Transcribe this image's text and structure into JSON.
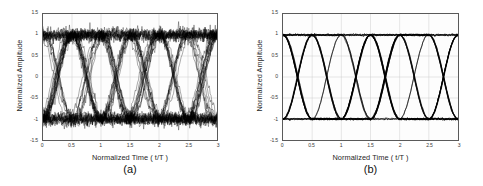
{
  "figure": {
    "background": "#ffffff",
    "trace_color": "#000000",
    "grid_color": "#c8c8c8",
    "axis_color": "#5a5a5a"
  },
  "panels": [
    {
      "caption": "(a)",
      "xlabel": "Normalized Time  ( t/T )",
      "ylabel": "Normalized Amplitude",
      "xticks": [
        "0",
        "0.5",
        "1",
        "1.5",
        "2",
        "2.5",
        "3"
      ],
      "yticks": [
        "1.5",
        "1",
        "0.5",
        "0",
        "-0.5",
        "-1",
        "-1.5"
      ]
    },
    {
      "caption": "(b)",
      "xlabel": "Normalized Time  ( t/T )",
      "ylabel": "Normalized Amplitude",
      "xticks": [
        "0",
        "0.5",
        "1",
        "1.5",
        "2",
        "2.5",
        "3"
      ],
      "yticks": [
        "1.5",
        "1",
        "0.5",
        "0",
        "-0.5",
        "-1",
        "-1.5"
      ]
    }
  ],
  "chart_data": [
    {
      "type": "line",
      "title": "(a)",
      "subtitle": "Eye diagram with high noise / jitter",
      "xlabel": "Normalized Time  ( t/T )",
      "ylabel": "Normalized Amplitude",
      "xlim": [
        0,
        3
      ],
      "ylim": [
        -1.5,
        1.5
      ],
      "xticks": [
        0,
        0.5,
        1,
        1.5,
        2,
        2.5,
        3
      ],
      "yticks": [
        1.5,
        1,
        0.5,
        0,
        -0.5,
        -1,
        -1.5
      ],
      "grid": true,
      "legend": "none",
      "eye": {
        "high_level": 1.0,
        "low_level": -1.0,
        "crossing_level": 0.0,
        "crossing_times": [
          0.5,
          1.0,
          1.5,
          2.0,
          2.5,
          3.0
        ],
        "symbol_period": 0.5,
        "amplitude_noise_std": 0.075,
        "timing_jitter_std": 0.035,
        "num_traces": 46,
        "eye_opening_vertical": 1.55,
        "eye_opening_horizontal": 0.36,
        "description": "Noisy eye diagram; thick fuzzy rails near +1 and -1, blurred crossings at 0"
      }
    },
    {
      "type": "line",
      "title": "(b)",
      "subtitle": "Eye diagram after equalization / clean",
      "xlabel": "Normalized Time  ( t/T )",
      "ylabel": "Normalized Amplitude",
      "xlim": [
        0,
        3
      ],
      "ylim": [
        -1.5,
        1.5
      ],
      "xticks": [
        0,
        0.5,
        1,
        1.5,
        2,
        2.5,
        3
      ],
      "yticks": [
        1.5,
        1,
        0.5,
        0,
        -0.5,
        -1,
        -1.5
      ],
      "grid": true,
      "legend": "none",
      "eye": {
        "high_level": 1.0,
        "low_level": -1.0,
        "crossing_level": 0.0,
        "crossing_times": [
          0.5,
          1.0,
          1.5,
          2.0,
          2.5,
          3.0
        ],
        "symbol_period": 0.5,
        "amplitude_noise_std": 0.012,
        "timing_jitter_std": 0.006,
        "num_traces": 28,
        "eye_opening_vertical": 1.94,
        "eye_opening_horizontal": 0.47,
        "description": "Clean wide-open eye diagram; sharp rails at +1 and -1, tight crossings at 0"
      }
    }
  ]
}
